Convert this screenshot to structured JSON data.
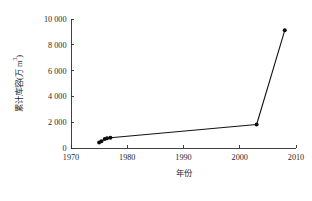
{
  "chart_data": {
    "type": "line",
    "title": "",
    "subtitle": "",
    "xlabel": "年份",
    "ylabel": "累计库容(万 m³)",
    "ylabel_parts": {
      "main": "累计库容(万 m",
      "superscript": "3",
      "tail": ")"
    },
    "xlim": [
      1970,
      2010
    ],
    "ylim": [
      0,
      10000
    ],
    "grid": false,
    "legend": false,
    "legend_position": "none",
    "x_ticks": [
      1970,
      1980,
      1990,
      2000,
      2010
    ],
    "x_tick_labels": [
      "1970",
      "1980",
      "1990",
      "2000",
      "2010"
    ],
    "y_ticks": [
      0,
      2000,
      4000,
      6000,
      8000,
      10000
    ],
    "y_tick_labels": [
      "0",
      "2 000",
      "4 000",
      "6 000",
      "8 000",
      "10 000"
    ],
    "marker": "filled-circle",
    "marker_color": "#0d0d0d",
    "line_color": "#111111",
    "axis_color": "#2b2b2b",
    "background_color": "#ffffff",
    "series": [
      {
        "name": "累计库容",
        "x": [
          1975,
          1975.4,
          1976,
          1976.4,
          1977,
          2003,
          2008
        ],
        "values": [
          430,
          520,
          700,
          760,
          790,
          1820,
          9120
        ]
      }
    ],
    "points": [
      {
        "x": 1975,
        "y": 430
      },
      {
        "x": 1975.4,
        "y": 520
      },
      {
        "x": 1976,
        "y": 700
      },
      {
        "x": 1976.4,
        "y": 760
      },
      {
        "x": 1977,
        "y": 790
      },
      {
        "x": 2003,
        "y": 1820
      },
      {
        "x": 2008,
        "y": 9120
      }
    ]
  }
}
